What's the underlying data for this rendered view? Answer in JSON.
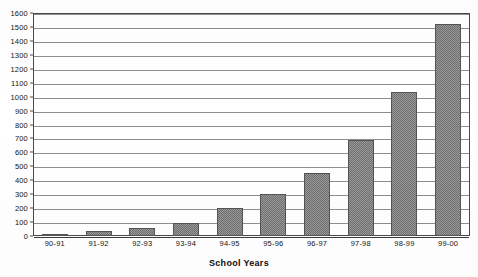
{
  "chart_data": {
    "type": "bar",
    "title": "",
    "xlabel": "School Years",
    "ylabel": "",
    "categories": [
      "90-91",
      "91-92",
      "92-93",
      "93-94",
      "94-95",
      "95-96",
      "96-97",
      "97-98",
      "98-99",
      "99-00"
    ],
    "values": [
      15,
      35,
      60,
      90,
      200,
      300,
      450,
      690,
      1030,
      1520
    ],
    "ylim": [
      0,
      1600
    ],
    "ytick_step": 100,
    "yticks": [
      0,
      100,
      200,
      300,
      400,
      500,
      600,
      700,
      800,
      900,
      1000,
      1100,
      1200,
      1300,
      1400,
      1500,
      1600
    ],
    "ytick_labels": [
      "0",
      "100",
      "200",
      "300",
      "400",
      "500",
      "600",
      "700",
      "800",
      "900",
      "1000",
      "1100",
      "1200",
      "1300",
      "1400",
      "1500",
      "1600"
    ],
    "grid": true,
    "legend": false,
    "legend_position": "none",
    "series": [
      {
        "name": "Count",
        "values": [
          15,
          35,
          60,
          90,
          200,
          300,
          450,
          690,
          1030,
          1520
        ]
      }
    ],
    "colors": {
      "bar_fill": "#9a9a9a",
      "bar_pattern": "#6f6f6f",
      "bar_border": "#545454",
      "gridline": "#8e8e8e",
      "axis": "#4a4a4a",
      "text": "#141414",
      "background": "#ffffff"
    }
  }
}
